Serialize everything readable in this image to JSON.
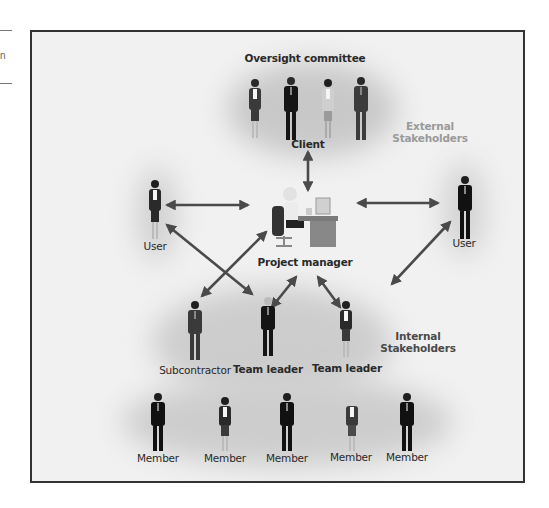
{
  "sidebar_fragment": {
    "partial_text": "n"
  },
  "diagram": {
    "title": "Oversight committee",
    "groups": {
      "external": {
        "label_line1": "External",
        "label_line2": "Stakeholders"
      },
      "internal": {
        "label_line1": "Internal",
        "label_line2": "Stakeholders"
      }
    },
    "nodes": {
      "client": "Client",
      "user_left": "User",
      "user_right": "User",
      "project_manager": "Project manager",
      "subcontractor": "Subcontractor",
      "team_leader_1": "Team leader",
      "team_leader_2": "Team leader",
      "members": [
        "Member",
        "Member",
        "Member",
        "Member",
        "Member"
      ]
    },
    "committee_members": [
      {
        "gender": "female"
      },
      {
        "gender": "male"
      },
      {
        "gender": "female"
      },
      {
        "gender": "male"
      }
    ],
    "connections": [
      {
        "from": "client",
        "to": "project_manager",
        "bidirectional": true
      },
      {
        "from": "user_left",
        "to": "project_manager",
        "bidirectional": true
      },
      {
        "from": "project_manager",
        "to": "user_right",
        "bidirectional": true
      },
      {
        "from": "user_right",
        "to": "team_leader_2",
        "bidirectional": true
      },
      {
        "from": "user_left",
        "to": "team_leader_1",
        "bidirectional": true
      },
      {
        "from": "project_manager",
        "to": "subcontractor",
        "bidirectional": true
      },
      {
        "from": "project_manager",
        "to": "team_leader_1",
        "bidirectional": true
      },
      {
        "from": "project_manager",
        "to": "team_leader_2",
        "bidirectional": true
      }
    ],
    "colors": {
      "background": "#f1f1f1",
      "frame": "#333333",
      "arrow": "#4a4a4a",
      "external_label": "#9a9a9a",
      "suit_dark": "#1a1a1a",
      "suit_gray": "#3c3c3c"
    }
  }
}
